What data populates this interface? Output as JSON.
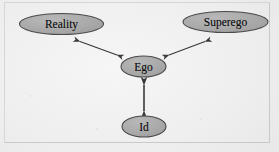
{
  "figure": {
    "background_color": "#eeeeee",
    "frame_color": "#d2d2d2",
    "node_fill": "#a9a9a9",
    "node_stroke": "#4a4a4a",
    "node_text_color": "#111111",
    "arrow_color": "#3a3a3a"
  },
  "nodes": [
    {
      "id": "reality",
      "label": "Reality",
      "cx": 61.5,
      "cy": 24,
      "rx": 42,
      "ry": 10.5,
      "font_size": 11.5
    },
    {
      "id": "superego",
      "label": "Superego",
      "cx": 225.5,
      "cy": 22,
      "rx": 42.5,
      "ry": 10.5,
      "font_size": 11.5
    },
    {
      "id": "ego",
      "label": "Ego",
      "cx": 143.5,
      "cy": 66.5,
      "rx": 22.5,
      "ry": 10.5,
      "font_size": 11.5
    },
    {
      "id": "id",
      "label": "Id",
      "cx": 144,
      "cy": 126.5,
      "rx": 22,
      "ry": 10.5,
      "font_size": 11.5
    }
  ],
  "connectors": [
    {
      "id": "reality-ego",
      "from": "reality",
      "to": "ego",
      "style": "double-headed-arrow",
      "x1": 80,
      "y1": 41.5,
      "x2": 117,
      "y2": 55
    },
    {
      "id": "superego-ego",
      "from": "superego",
      "to": "ego",
      "style": "double-headed-arrow",
      "x1": 205,
      "y1": 41.5,
      "x2": 169,
      "y2": 55
    },
    {
      "id": "ego-id",
      "from": "ego",
      "to": "id",
      "style": "double-headed-arrow",
      "x1": 144,
      "y1": 85,
      "x2": 144,
      "y2": 111
    }
  ]
}
